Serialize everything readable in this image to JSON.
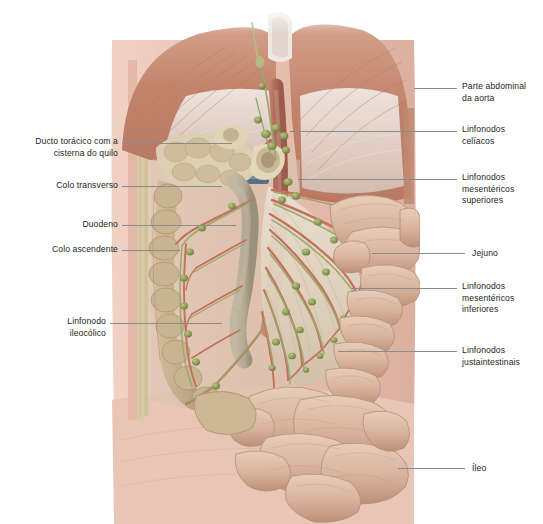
{
  "figure": {
    "kind": "anatomical-illustration",
    "language": "pt-BR",
    "background_color": "#ffffff",
    "width": 543,
    "height": 524
  },
  "palette": {
    "diaphragm_muscle": "#c2836c",
    "diaphragm_tendon": "#e8dcd6",
    "aorta": "#b5705f",
    "artery": "#c4705c",
    "vein": "#5d6f86",
    "lymph_node": "#8a9a55",
    "lymph_vessel": "#9aa86a",
    "small_intestine": "#d8b29c",
    "large_intestine": "#c4a98a",
    "mesentery": "#e5d9c8",
    "abdominal_wall": "#e8c4b4",
    "peritoneum": "#d9c9a8",
    "leader_line": "#8b8b8b",
    "label_text": "#231f20",
    "duodenum": "#b3a894"
  },
  "labels_left": [
    {
      "id": "ducto-toracico",
      "text": "Ducto torácico com a\ncisterna do quilo",
      "x": 8,
      "y": 136,
      "line": {
        "x1": 122,
        "x2": 232,
        "y": 143
      }
    },
    {
      "id": "colo-transverso",
      "text": "Colo transverso",
      "x": 22,
      "y": 180,
      "line": {
        "x1": 122,
        "x2": 222,
        "y": 186
      }
    },
    {
      "id": "duodeno",
      "text": "Duodeno",
      "x": 48,
      "y": 219,
      "line": {
        "x1": 122,
        "x2": 236,
        "y": 225
      }
    },
    {
      "id": "colo-ascendente",
      "text": "Colo ascendente",
      "x": 22,
      "y": 244,
      "line": {
        "x1": 122,
        "x2": 180,
        "y": 250
      }
    },
    {
      "id": "linfonodo-ileocolico",
      "text": "Linfonodo\nileocólico",
      "x": 40,
      "y": 316,
      "line": {
        "x1": 110,
        "x2": 222,
        "y": 323
      }
    }
  ],
  "labels_right": [
    {
      "id": "parte-abdominal-aorta",
      "text": "Parte abdominal\nda aorta",
      "x": 462,
      "y": 81,
      "line": {
        "x1": 414,
        "x2": 457,
        "y": 88
      }
    },
    {
      "id": "linfonodos-celiacos",
      "text": "Linfonodos\ncelíacos",
      "x": 462,
      "y": 124,
      "line": {
        "x1": 290,
        "x2": 457,
        "y": 131
      }
    },
    {
      "id": "linfonodos-mesentericos-superiores",
      "text": "Linfonodos\nmesentéricos\nsuperiores",
      "x": 462,
      "y": 172,
      "line": {
        "x1": 298,
        "x2": 457,
        "y": 179
      }
    },
    {
      "id": "jejuno",
      "text": "Jejuno",
      "x": 472,
      "y": 249,
      "line": {
        "x1": 372,
        "x2": 465,
        "y": 253
      }
    },
    {
      "id": "linfonodos-mesentericos-inferiores",
      "text": "Linfonodos\nmesentéricos\ninferiores",
      "x": 462,
      "y": 281,
      "line": {
        "x1": 352,
        "x2": 457,
        "y": 288
      }
    },
    {
      "id": "linfonodos-justaintestinais",
      "text": "Linfonodos\njustaintestinais",
      "x": 462,
      "y": 345,
      "line": {
        "x1": 338,
        "x2": 457,
        "y": 351
      }
    },
    {
      "id": "ileo",
      "text": "Íleo",
      "x": 472,
      "y": 464,
      "line": {
        "x1": 398,
        "x2": 465,
        "y": 468
      }
    }
  ],
  "structures": [
    {
      "id": "diaphragm-left",
      "name": "Diafragma (cúpula esquerda)"
    },
    {
      "id": "diaphragm-right",
      "name": "Diafragma (cúpula direita)"
    },
    {
      "id": "aorta",
      "name": "Parte abdominal da aorta"
    },
    {
      "id": "transverse-colon",
      "name": "Colo transverso (coto seccionado)"
    },
    {
      "id": "ascending-colon",
      "name": "Colo ascendente"
    },
    {
      "id": "duodenum",
      "name": "Duodeno"
    },
    {
      "id": "jejunum",
      "name": "Jejuno"
    },
    {
      "id": "ileum",
      "name": "Íleo"
    },
    {
      "id": "mesentery",
      "name": "Mesentério"
    },
    {
      "id": "thoracic-duct",
      "name": "Ducto torácico com a cisterna do quilo"
    },
    {
      "id": "abdominal-wall",
      "name": "Parede abdominal"
    }
  ]
}
